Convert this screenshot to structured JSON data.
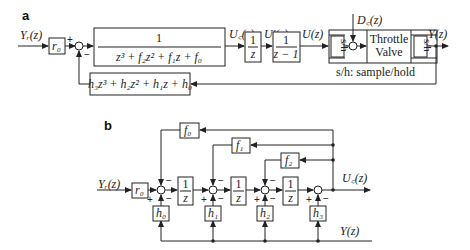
{
  "panel_a": {
    "label": "a",
    "input": "Y_r(z)",
    "input_text": "Yᵣ(z)",
    "r0": "r₀",
    "plant": {
      "num": "1",
      "den": "z³ + f₂z² + f₁z + f₀"
    },
    "uc": "U꜀(z)",
    "integrator": {
      "num": "1",
      "den": "z"
    },
    "uprime": "U′(z)",
    "accum": {
      "num": "1",
      "den": "z − 1"
    },
    "u": "U(z)",
    "sh_left": "s/h",
    "disturbance": "D꜀(z)",
    "throttle_line1": "Throttle",
    "throttle_line2": "Valve",
    "sh_right": "s/h",
    "output": "Y(z)",
    "sh_note": "s/h: sample/hold",
    "feedback": "h₃z³ + h₂z² + h₁z + h₀",
    "sign_plus": "+",
    "sign_minus": "−"
  },
  "panel_b": {
    "label": "b",
    "input": "Yᵣ(z)",
    "r0": "r₀",
    "f0": "f₀",
    "f1": "f₁",
    "f2": "f₂",
    "h0": "h₀",
    "h1": "h₁",
    "h2": "h₂",
    "h3": "h₃",
    "delay_num": "1",
    "delay_den": "z",
    "uc": "U꜀(z)",
    "y": "Y(z)",
    "sign_plus": "+",
    "sign_minus": "−"
  }
}
